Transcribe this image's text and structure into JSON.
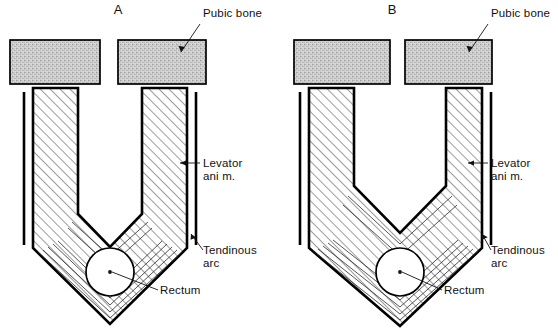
{
  "figure": {
    "background_color": "#ffffff",
    "ink_color": "#000000",
    "bone_fill_color": "#c9c9c9",
    "muscle_fill_color": "#ffffff",
    "hatch_color": "#2a2a2a",
    "width": 558,
    "height": 330
  },
  "panels": [
    {
      "id": "A",
      "letter": "A",
      "letter_x": 118,
      "letter_y": 14,
      "labels": [
        {
          "key": "pubic_bone",
          "text": "Pubic bone",
          "line1": "Pubic bone",
          "line2": "",
          "x": 203,
          "y": 17
        },
        {
          "key": "levator_ani",
          "text": "Levator ani m.",
          "line1": "Levator",
          "line2": "ani m.",
          "x": 203,
          "y": 167
        },
        {
          "key": "tendinous_arc",
          "text": "Tendinous arc",
          "line1": "Tendinous",
          "line2": "arc",
          "x": 203,
          "y": 248
        },
        {
          "key": "rectum",
          "text": "Rectum",
          "line1": "Rectum",
          "line2": "",
          "x": 160,
          "y": 293
        }
      ]
    },
    {
      "id": "B",
      "letter": "B",
      "letter_x": 392,
      "letter_y": 14,
      "labels": [
        {
          "key": "pubic_bone",
          "text": "Pubic bone",
          "line1": "Pubic bone",
          "line2": "",
          "x": 490,
          "y": 17
        },
        {
          "key": "levator_ani",
          "text": "Levator ani m.",
          "line1": "Levator",
          "line2": "ani m.",
          "x": 490,
          "y": 167
        },
        {
          "key": "tendinous_arc",
          "text": "Tendinous arc",
          "line1": "Tendinous",
          "line2": "arc",
          "x": 490,
          "y": 248
        },
        {
          "key": "rectum",
          "text": "Rectum",
          "line1": "Rectum",
          "line2": "",
          "x": 444,
          "y": 293
        }
      ]
    }
  ],
  "structures": {
    "pubic_bone_label": "Pubic bone",
    "levator_ani_label_line1": "Levator",
    "levator_ani_label_line2": "ani m.",
    "tendinous_arc_label_line1": "Tendinous",
    "tendinous_arc_label_line2": "arc",
    "rectum_label": "Rectum"
  },
  "caption": {
    "text": ""
  }
}
